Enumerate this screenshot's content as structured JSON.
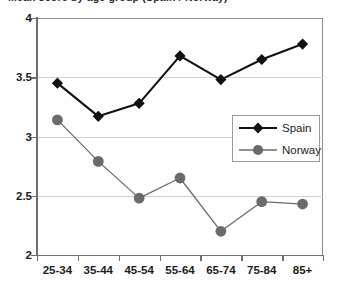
{
  "chart": {
    "title_clipped": "Mean score by age group (Spain / Norway)",
    "legend_position": "center-right"
  },
  "chart_data": {
    "type": "line",
    "title": "",
    "xlabel": "",
    "ylabel": "",
    "categories": [
      "25-34",
      "35-44",
      "45-54",
      "55-64",
      "65-74",
      "75-84",
      "85+"
    ],
    "ylim": [
      2,
      4
    ],
    "yticks": [
      2,
      2.5,
      3,
      3.5,
      4
    ],
    "ytick_labels": [
      "2",
      "2.5",
      "3",
      "3.5",
      "4"
    ],
    "grid": true,
    "legend": [
      "Spain",
      "Norway"
    ],
    "series": [
      {
        "name": "Spain",
        "marker": "diamond",
        "color": "#111111",
        "values": [
          3.45,
          3.17,
          3.28,
          3.68,
          3.48,
          3.65,
          3.78
        ]
      },
      {
        "name": "Norway",
        "marker": "circle",
        "color": "#6b6b6b",
        "values": [
          3.14,
          2.79,
          2.48,
          2.65,
          2.2,
          2.45,
          2.43
        ]
      }
    ]
  },
  "colors": {
    "spain": "#111111",
    "norway": "#6b6b6b",
    "gridline": "#d2d2d2",
    "axis": "#6e6e6e",
    "text": "#1c1c1c",
    "background": "#ffffff"
  }
}
